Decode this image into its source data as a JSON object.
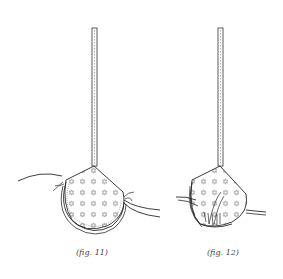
{
  "figures": [
    {
      "id": "fig11",
      "caption": "(fig. 11)",
      "description": "bra cup with strap attached, threads pulled at both sides of the band casing"
    },
    {
      "id": "fig12",
      "caption": "(fig. 12)",
      "description": "bra cup with strap attached, casing gathered with threads tied at the bottom"
    }
  ],
  "colors": {
    "line": "#2a2a2a",
    "pattern": "#b5b5b5",
    "background": "#ffffff"
  }
}
